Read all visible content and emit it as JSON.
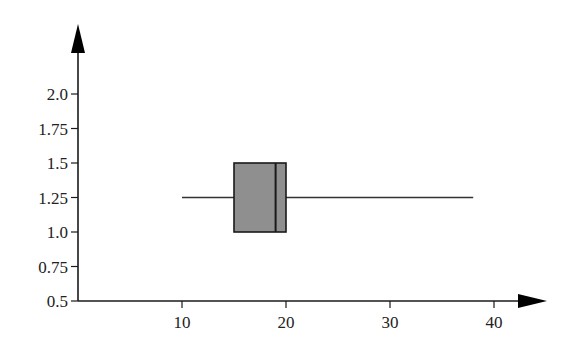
{
  "chart_data": {
    "type": "boxplot",
    "title": "",
    "xlabel": "",
    "ylabel": "",
    "xlim": [
      0,
      44
    ],
    "ylim": [
      0.5,
      2.3
    ],
    "x_ticks": [
      10,
      20,
      30,
      40
    ],
    "x_tick_labels": [
      "10",
      "20",
      "30",
      "40"
    ],
    "y_ticks": [
      0.5,
      0.75,
      1.0,
      1.25,
      1.5,
      1.75,
      2.0
    ],
    "y_tick_labels": [
      "0.5",
      "0.75",
      "1.0",
      "1.25",
      "1.5",
      "1.75",
      "2.0"
    ],
    "grid": false,
    "legend": null,
    "boxes": [
      {
        "orientation": "horizontal",
        "min": 10,
        "q1": 15,
        "median": 19,
        "q3": 20,
        "max": 38,
        "y_center": 1.25,
        "y_bottom": 1.0,
        "y_top": 1.5,
        "fill_color": "#8f8f8f"
      }
    ]
  },
  "colors": {
    "axis": "#1a1a1a",
    "box_fill": "#8f8f8f",
    "box_stroke": "#1a1a1a",
    "whisker": "#333333"
  }
}
